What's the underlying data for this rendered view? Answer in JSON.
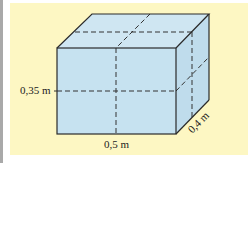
{
  "diagram": {
    "type": "rectangular-prism",
    "colors": {
      "panel_background": "#fdf7c3",
      "box_fill": "#c6e2f0",
      "edge": "#2b2b2b",
      "hidden_edge": "#3a3a3a"
    },
    "labels": {
      "height": "0,35 m",
      "width": "0,5 m",
      "depth": "0,4 m"
    },
    "dimensions": {
      "width_m": 0.5,
      "height_m": 0.35,
      "depth_m": 0.4
    }
  }
}
